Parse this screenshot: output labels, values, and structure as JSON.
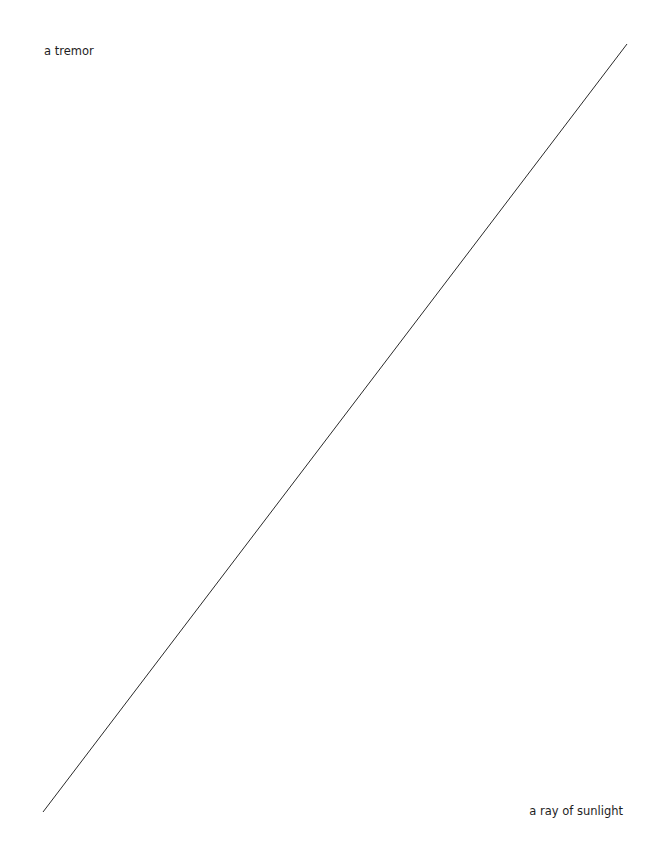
{
  "diagram": {
    "line": {
      "x1": 43,
      "y1": 812,
      "x2": 627,
      "y2": 44,
      "color": "#2a2a2a",
      "width": 1
    },
    "labels": {
      "top_left": "a tremor",
      "bottom_right": "a ray of sunlight"
    }
  }
}
